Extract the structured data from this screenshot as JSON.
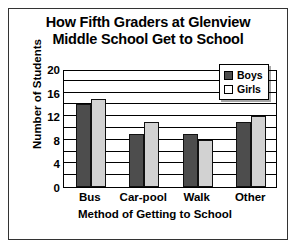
{
  "chart_data": {
    "type": "bar",
    "title": "How Fifth Graders at Glenview Middle School Get to School",
    "title_lines": [
      "How Fifth Graders at Glenview",
      "Middle School Get to School"
    ],
    "xlabel": "Method of Getting to School",
    "ylabel": "Number of Students",
    "categories": [
      "Bus",
      "Car-pool",
      "Walk",
      "Other"
    ],
    "series": [
      {
        "name": "Boys",
        "color": "#4d4d4d",
        "values": [
          14,
          9,
          9,
          11
        ]
      },
      {
        "name": "Girls",
        "color": "#d2d2d2",
        "values": [
          15,
          11,
          8,
          12
        ]
      }
    ],
    "ylim": [
      0,
      20
    ],
    "yticks": [
      0,
      4,
      8,
      12,
      16,
      20
    ],
    "ytick_labels": [
      "0",
      "4",
      "8",
      "12",
      "16",
      "20"
    ],
    "minor_gridline_step": 2,
    "grid": true,
    "legend_position": "top-right",
    "legend_entries": [
      "Boys",
      "Girls"
    ]
  }
}
